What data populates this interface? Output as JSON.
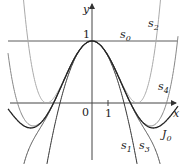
{
  "diagram": {
    "axes": {
      "x_label": "x",
      "y_label": "y",
      "origin_label": "0",
      "x_tick_label": "1",
      "y_tick_label": "1"
    },
    "curves": [
      {
        "id": "s0",
        "label": "s",
        "sub": "0",
        "formula": "1",
        "color": "#444444"
      },
      {
        "id": "s1",
        "label": "s",
        "sub": "1",
        "formula": "1 - x^2/4",
        "color": "#333333"
      },
      {
        "id": "s2",
        "label": "s",
        "sub": "2",
        "formula": "1 - x^2/4 + x^4/64",
        "color": "#aaaaaa"
      },
      {
        "id": "s3",
        "label": "s",
        "sub": "3",
        "formula": "1 - x^2/4 + x^4/64 - x^6/2304",
        "color": "#555555"
      },
      {
        "id": "s4",
        "label": "s",
        "sub": "4",
        "formula": "1 - x^2/4 + x^4/64 - x^6/2304 + x^8/147456",
        "color": "#888888"
      },
      {
        "id": "J0",
        "label": "J",
        "sub": "0",
        "formula": "J0(x)",
        "color": "#222222"
      }
    ]
  }
}
